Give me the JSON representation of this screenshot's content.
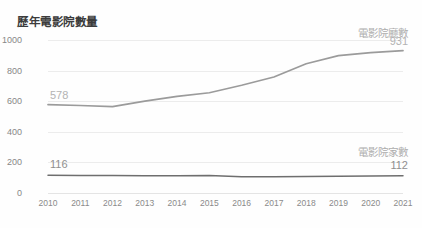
{
  "chart_data": {
    "type": "line",
    "title": "歷年電影院數量",
    "xlabel": "",
    "ylabel": "",
    "ylim": [
      0,
      1000
    ],
    "yticks": [
      0,
      200,
      400,
      600,
      800,
      1000
    ],
    "ytick_labels": [
      "0",
      "200",
      "400",
      "600",
      "800",
      "1000"
    ],
    "grid": true,
    "legend_position": "inline-right",
    "categories": [
      "2010",
      "2011",
      "2012",
      "2013",
      "2014",
      "2015",
      "2016",
      "2017",
      "2018",
      "2019",
      "2020",
      "2021"
    ],
    "series": [
      {
        "name": "電影院廳數",
        "color": "#9b9b9b",
        "values": [
          578,
          572,
          565,
          600,
          631,
          655,
          704,
          758,
          845,
          898,
          918,
          931
        ],
        "start_label": "578",
        "end_label": "931"
      },
      {
        "name": "電影院家數",
        "color": "#6e6e6e",
        "values": [
          116,
          115,
          114,
          113,
          112,
          114,
          106,
          107,
          108,
          110,
          111,
          112
        ],
        "start_label": "116",
        "end_label": "112"
      }
    ]
  },
  "axis": {
    "y_ticks": [
      {
        "label": "1000",
        "value": 1000
      },
      {
        "label": "800",
        "value": 800
      },
      {
        "label": "600",
        "value": 600
      },
      {
        "label": "400",
        "value": 400
      },
      {
        "label": "200",
        "value": 200
      },
      {
        "label": "0",
        "value": 0
      }
    ],
    "x_ticks": [
      "2010",
      "2011",
      "2012",
      "2013",
      "2014",
      "2015",
      "2016",
      "2017",
      "2018",
      "2019",
      "2020",
      "2021"
    ]
  },
  "annotations": {
    "screens_series_label": "電影院廳數",
    "screens_end_value": "931",
    "screens_start_value": "578",
    "cinemas_series_label": "電影院家數",
    "cinemas_end_value": "112",
    "cinemas_start_value": "116"
  },
  "colors": {
    "screens_line": "#9b9b9b",
    "cinemas_line": "#6e6e6e",
    "grid": "#ececec",
    "title_text": "#3c3c3c",
    "tick_text": "#8a8a8a",
    "annotation_text": "#b3b3b3",
    "background": "#fefefe"
  }
}
